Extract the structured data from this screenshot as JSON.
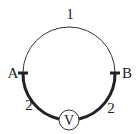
{
  "diagram": {
    "title": "",
    "labels": {
      "top_arc": "1",
      "left_arc": "2",
      "right_arc": "2",
      "point_a": "A",
      "point_b": "B",
      "meter": "V"
    },
    "components": [
      {
        "id": "top-arc",
        "kind": "thin-wire",
        "label": "1"
      },
      {
        "id": "left-arc",
        "kind": "thick-wire",
        "label": "2"
      },
      {
        "id": "right-arc",
        "kind": "thick-wire",
        "label": "2"
      },
      {
        "id": "voltmeter",
        "kind": "meter",
        "label": "V"
      }
    ],
    "colors": {
      "line": "#222222",
      "background": "#ffffff"
    }
  }
}
